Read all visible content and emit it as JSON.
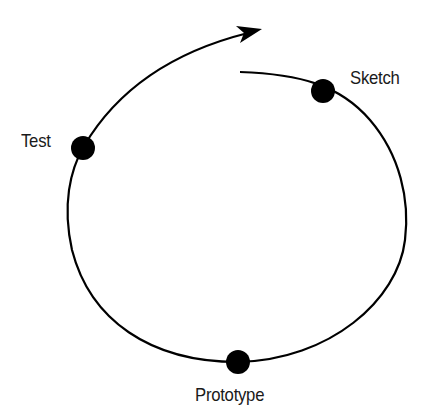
{
  "diagram": {
    "type": "iterative-cycle",
    "direction": "counter-clockwise",
    "stages": [
      {
        "label": "Sketch"
      },
      {
        "label": "Prototype"
      },
      {
        "label": "Test"
      }
    ],
    "colors": {
      "line": "#000000",
      "node": "#000000",
      "text": "#1a1a1a",
      "background": "#ffffff"
    }
  }
}
